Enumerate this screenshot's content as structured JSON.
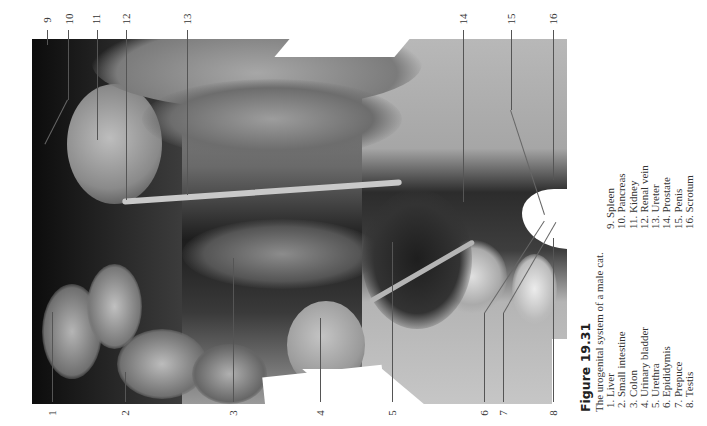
{
  "figure": {
    "title": "Figure 19.31",
    "subtitle": "The urogenital system of a male cat.",
    "legend_left": [
      "1. Liver",
      "2. Small intestine",
      "3. Colon",
      "4. Urinary bladder",
      "5. Urethra",
      "6. Epididymis",
      "7. Prepuce",
      "8. Testis"
    ],
    "legend_right": [
      "9. Spleen",
      "10. Pancreas",
      "11. Kidney",
      "12. Renal vein",
      "13. Ureter",
      "14. Prostate",
      "15. Penis",
      "16. Scrotum"
    ]
  },
  "labels": {
    "bottom": [
      "1",
      "2",
      "3",
      "4",
      "5",
      "6",
      "7",
      "8"
    ],
    "top": [
      "9",
      "10",
      "11",
      "12",
      "13",
      "14",
      "15",
      "16"
    ]
  },
  "photo": {
    "description": "Grayscale dissection photograph of a male cat urogenital system",
    "tone": "grayscale"
  }
}
